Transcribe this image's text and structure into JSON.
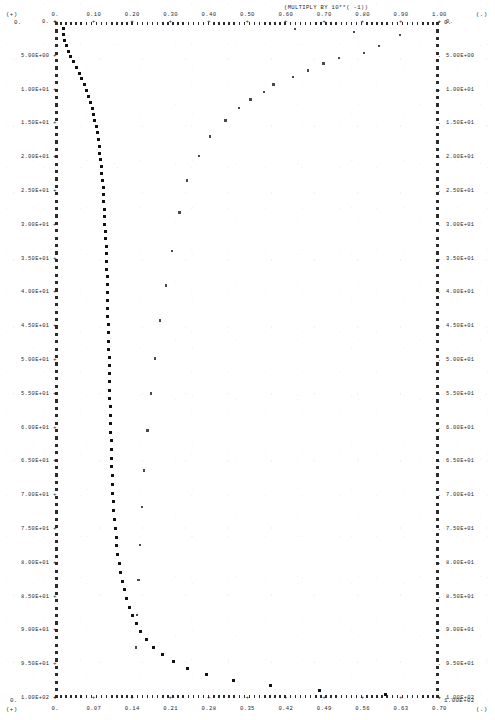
{
  "header": {
    "multiply_note": "(MULTIPLY BY 10**( -1))",
    "corner_top_left_marker": "(+)",
    "corner_top_left_value": "0.",
    "corner_top_right_marker": "(.)",
    "corner_top_right_value": "0.",
    "corner_bottom_left_marker": "(+)",
    "corner_bottom_left_value": "0.",
    "corner_bottom_right_marker": "(.)",
    "corner_bottom_right_value": "1.00E+02"
  },
  "chart_data": {
    "type": "scatter",
    "title": "",
    "subtitle": "(MULTIPLY BY 10**( -1))",
    "xlabel": "",
    "ylabel": "",
    "grid": false,
    "legend": "none",
    "y_axis_inverted": true,
    "top_axis": {
      "label_scale_note": "(MULTIPLY BY 10**( -1))",
      "marker": "+",
      "range": [
        0.0,
        1.0
      ],
      "ticks": [
        "0.",
        "0.10",
        "0.20",
        "0.30",
        "0.40",
        "0.50",
        "0.60",
        "0.70",
        "0.80",
        "0.90",
        "1.00"
      ],
      "tick_values": [
        0.0,
        0.1,
        0.2,
        0.3,
        0.4,
        0.5,
        0.6,
        0.7,
        0.8,
        0.9,
        1.0
      ]
    },
    "bottom_axis": {
      "marker": "+",
      "range": [
        0.0,
        0.7
      ],
      "ticks": [
        "0.",
        "0.07",
        "0.14",
        "0.21",
        "0.28",
        "0.35",
        "0.42",
        "0.49",
        "0.56",
        "0.63",
        "0.70"
      ],
      "tick_values": [
        0.0,
        0.07,
        0.14,
        0.21,
        0.28,
        0.35,
        0.42,
        0.49,
        0.56,
        0.63,
        0.7
      ]
    },
    "left_axis": {
      "marker": "+",
      "range": [
        0.0,
        100.0
      ],
      "ticks": [
        "0.",
        "5.00E+00",
        "1.00E+01",
        "1.50E+01",
        "2.00E+01",
        "2.50E+01",
        "3.00E+01",
        "3.50E+01",
        "4.00E+01",
        "4.50E+01",
        "5.00E+01",
        "5.50E+01",
        "6.00E+01",
        "6.50E+01",
        "7.00E+01",
        "7.50E+01",
        "8.00E+01",
        "8.50E+01",
        "9.00E+01",
        "9.50E+01",
        "1.00E+02"
      ],
      "tick_values": [
        0,
        5,
        10,
        15,
        20,
        25,
        30,
        35,
        40,
        45,
        50,
        55,
        60,
        65,
        70,
        75,
        80,
        85,
        90,
        95,
        100
      ]
    },
    "right_axis": {
      "marker": ".",
      "range": [
        0.0,
        100.0
      ],
      "ticks": [
        "0.",
        "5.00E+00",
        "1.00E+01",
        "1.50E+01",
        "2.00E+01",
        "2.50E+01",
        "3.00E+01",
        "3.50E+01",
        "4.00E+01",
        "4.50E+01",
        "5.00E+01",
        "5.50E+01",
        "6.00E+01",
        "6.50E+01",
        "7.00E+01",
        "7.50E+01",
        "8.00E+01",
        "8.50E+01",
        "9.00E+01",
        "9.50E+01",
        "1.00E+02"
      ],
      "tick_values": [
        0,
        5,
        10,
        15,
        20,
        25,
        30,
        35,
        40,
        45,
        50,
        55,
        60,
        65,
        70,
        75,
        80,
        85,
        90,
        95,
        100
      ]
    },
    "series": [
      {
        "name": "primary-profile",
        "marker": "+",
        "x_axis": "top",
        "y_axis": "left",
        "points": [
          [
            0.021,
            1.0
          ],
          [
            0.023,
            1.9
          ],
          [
            0.026,
            2.7
          ],
          [
            0.03,
            3.5
          ],
          [
            0.035,
            4.3
          ],
          [
            0.041,
            5.1
          ],
          [
            0.048,
            5.9
          ],
          [
            0.056,
            6.7
          ],
          [
            0.063,
            7.6
          ],
          [
            0.07,
            8.4
          ],
          [
            0.076,
            9.2
          ],
          [
            0.082,
            10.1
          ],
          [
            0.088,
            11.0
          ],
          [
            0.093,
            11.9
          ],
          [
            0.097,
            12.8
          ],
          [
            0.101,
            13.7
          ],
          [
            0.104,
            14.6
          ],
          [
            0.107,
            15.5
          ],
          [
            0.11,
            16.4
          ],
          [
            0.113,
            17.4
          ],
          [
            0.115,
            18.4
          ],
          [
            0.117,
            19.4
          ],
          [
            0.119,
            20.4
          ],
          [
            0.121,
            21.4
          ],
          [
            0.122,
            22.4
          ],
          [
            0.124,
            23.4
          ],
          [
            0.125,
            24.5
          ],
          [
            0.126,
            25.5
          ],
          [
            0.127,
            26.6
          ],
          [
            0.128,
            27.7
          ],
          [
            0.129,
            28.8
          ],
          [
            0.13,
            29.9
          ],
          [
            0.131,
            31.0
          ],
          [
            0.132,
            32.1
          ],
          [
            0.133,
            33.2
          ],
          [
            0.134,
            34.3
          ],
          [
            0.134,
            35.5
          ],
          [
            0.135,
            36.6
          ],
          [
            0.136,
            37.7
          ],
          [
            0.136,
            38.9
          ],
          [
            0.137,
            40.0
          ],
          [
            0.137,
            41.2
          ],
          [
            0.138,
            42.4
          ],
          [
            0.138,
            43.6
          ],
          [
            0.139,
            44.8
          ],
          [
            0.139,
            46.0
          ],
          [
            0.14,
            47.2
          ],
          [
            0.14,
            48.4
          ],
          [
            0.141,
            49.6
          ],
          [
            0.141,
            50.8
          ],
          [
            0.142,
            52.0
          ],
          [
            0.142,
            53.2
          ],
          [
            0.143,
            54.5
          ],
          [
            0.143,
            55.7
          ],
          [
            0.144,
            56.9
          ],
          [
            0.144,
            58.2
          ],
          [
            0.145,
            59.4
          ],
          [
            0.145,
            60.7
          ],
          [
            0.146,
            61.9
          ],
          [
            0.147,
            63.2
          ],
          [
            0.147,
            64.5
          ],
          [
            0.148,
            65.8
          ],
          [
            0.149,
            67.1
          ],
          [
            0.15,
            68.4
          ],
          [
            0.151,
            69.7
          ],
          [
            0.152,
            71.0
          ],
          [
            0.153,
            72.3
          ],
          [
            0.155,
            73.6
          ],
          [
            0.157,
            74.9
          ],
          [
            0.159,
            76.2
          ],
          [
            0.161,
            77.5
          ],
          [
            0.164,
            78.8
          ],
          [
            0.167,
            80.1
          ],
          [
            0.171,
            81.4
          ],
          [
            0.175,
            82.7
          ],
          [
            0.18,
            84.0
          ],
          [
            0.186,
            85.3
          ],
          [
            0.193,
            86.6
          ],
          [
            0.201,
            87.8
          ],
          [
            0.211,
            89.0
          ],
          [
            0.223,
            90.2
          ],
          [
            0.238,
            91.4
          ],
          [
            0.256,
            92.5
          ],
          [
            0.279,
            93.6
          ],
          [
            0.308,
            94.6
          ],
          [
            0.345,
            95.6
          ],
          [
            0.395,
            96.5
          ],
          [
            0.465,
            97.4
          ],
          [
            0.56,
            98.2
          ],
          [
            0.69,
            98.9
          ],
          [
            0.86,
            99.5
          ]
        ]
      },
      {
        "name": "secondary-profile",
        "marker": ".",
        "x_axis": "top",
        "y_axis": "left",
        "points": [
          [
            0.625,
            1.1
          ],
          [
            0.78,
            1.5
          ],
          [
            0.9,
            2.0
          ],
          [
            0.845,
            3.6
          ],
          [
            0.805,
            4.6
          ],
          [
            0.74,
            5.4
          ],
          [
            0.7,
            6.2
          ],
          [
            0.66,
            7.2
          ],
          [
            0.62,
            8.2
          ],
          [
            0.57,
            9.3
          ],
          [
            0.545,
            10.4
          ],
          [
            0.51,
            11.5
          ],
          [
            0.48,
            12.8
          ],
          [
            0.445,
            14.6
          ],
          [
            0.405,
            17.0
          ],
          [
            0.375,
            19.9
          ],
          [
            0.345,
            23.5
          ],
          [
            0.325,
            28.2
          ],
          [
            0.305,
            33.9
          ],
          [
            0.29,
            39.0
          ],
          [
            0.275,
            44.2
          ],
          [
            0.262,
            49.8
          ],
          [
            0.25,
            55.0
          ],
          [
            0.242,
            60.5
          ],
          [
            0.233,
            66.4
          ],
          [
            0.228,
            71.8
          ],
          [
            0.222,
            77.4
          ],
          [
            0.218,
            82.6
          ],
          [
            0.214,
            87.8
          ],
          [
            0.211,
            92.6
          ]
        ]
      }
    ]
  }
}
